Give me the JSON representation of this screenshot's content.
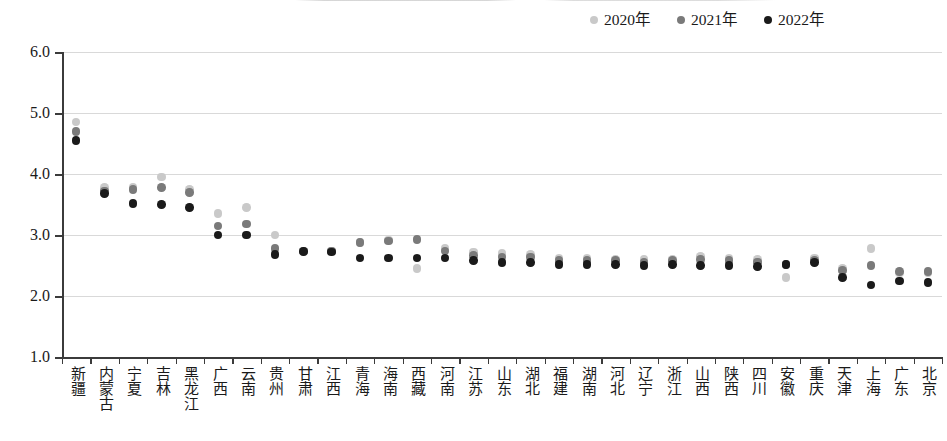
{
  "legend": {
    "position": "top-right",
    "entries": [
      {
        "label": "2020年",
        "color": "#c9c9c9"
      },
      {
        "label": "2021年",
        "color": "#7a7a7a"
      },
      {
        "label": "2022年",
        "color": "#1a1a1a"
      }
    ]
  },
  "axis": {
    "y_ticks": [
      "6.0",
      "5.0",
      "4.0",
      "3.0",
      "2.0",
      "1.0"
    ],
    "y_min": 1.0,
    "y_max": 6.0,
    "y_step": 1.0
  },
  "chart_data": {
    "type": "scatter",
    "title": "",
    "xlabel": "",
    "ylabel": "",
    "ylim": [
      1.0,
      6.0
    ],
    "grid": true,
    "legend_position": "top-right",
    "categories": [
      "新疆",
      "内蒙古",
      "宁夏",
      "吉林",
      "黑龙江",
      "广西",
      "云南",
      "贵州",
      "甘肃",
      "江西",
      "青海",
      "海南",
      "西藏",
      "河南",
      "江苏",
      "山东",
      "湖北",
      "福建",
      "湖南",
      "河北",
      "辽宁",
      "浙江",
      "山西",
      "陕西",
      "四川",
      "安徽",
      "重庆",
      "天津",
      "上海",
      "广东",
      "北京"
    ],
    "series": [
      {
        "name": "2020年",
        "color": "#c9c9c9",
        "values": [
          4.85,
          3.78,
          3.78,
          3.95,
          3.75,
          3.35,
          3.45,
          3.0,
          2.72,
          2.73,
          2.88,
          2.92,
          2.45,
          2.78,
          2.72,
          2.7,
          2.68,
          2.62,
          2.62,
          2.6,
          2.6,
          2.6,
          2.65,
          2.62,
          2.6,
          2.3,
          2.62,
          2.45,
          2.78,
          2.38,
          2.38
        ]
      },
      {
        "name": "2021年",
        "color": "#7a7a7a",
        "values": [
          4.7,
          3.72,
          3.75,
          3.78,
          3.7,
          3.15,
          3.18,
          2.78,
          2.74,
          2.74,
          2.88,
          2.9,
          2.93,
          2.74,
          2.66,
          2.64,
          2.64,
          2.58,
          2.58,
          2.58,
          2.56,
          2.58,
          2.6,
          2.58,
          2.56,
          2.52,
          2.58,
          2.42,
          2.5,
          2.4,
          2.4
        ]
      },
      {
        "name": "2022年",
        "color": "#1a1a1a",
        "values": [
          4.55,
          3.68,
          3.52,
          3.5,
          3.45,
          3.0,
          3.0,
          2.68,
          2.73,
          2.72,
          2.62,
          2.62,
          2.62,
          2.62,
          2.58,
          2.55,
          2.55,
          2.52,
          2.52,
          2.52,
          2.5,
          2.52,
          2.5,
          2.5,
          2.48,
          2.52,
          2.55,
          2.3,
          2.18,
          2.25,
          2.22
        ]
      }
    ]
  }
}
